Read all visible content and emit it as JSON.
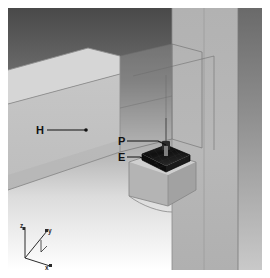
{
  "view": {
    "title": "3D beam-to-column connection model",
    "width": 270,
    "height": 278,
    "background_top": "#4a4a4a",
    "background_bottom": "#ffffff",
    "canvas_rect": {
      "x": 8,
      "y": 8,
      "width": 254,
      "height": 262
    }
  },
  "labels": {
    "beam": {
      "text": "H",
      "x": 36,
      "y": 133
    },
    "plate": {
      "text": "P",
      "x": 119,
      "y": 141
    },
    "embed": {
      "text": "E",
      "x": 119,
      "y": 156
    }
  },
  "axes": {
    "origin_label": "",
    "z": "z",
    "y": "y",
    "x": "x",
    "color": "#2a2a2a"
  },
  "colors": {
    "beam_top": "#d2d2d2",
    "beam_front": "#bfbfbf",
    "beam_side": "#a8a8a8",
    "column_front": "#b5b5b5",
    "column_side": "#9a9a9a",
    "corbel_top": "#c9c9c9",
    "corbel_front": "#b0b0b0",
    "embed_plate": "#141414",
    "stud": "#2b2b2b",
    "wire": "#5a5a5a",
    "leader": "#111111"
  },
  "parts": [
    {
      "id": "H",
      "name": "beam",
      "description": "horizontal concrete beam"
    },
    {
      "id": "P",
      "name": "plate",
      "description": "steel plate / stud"
    },
    {
      "id": "E",
      "name": "embed",
      "description": "embedded plate in column corbel"
    }
  ]
}
